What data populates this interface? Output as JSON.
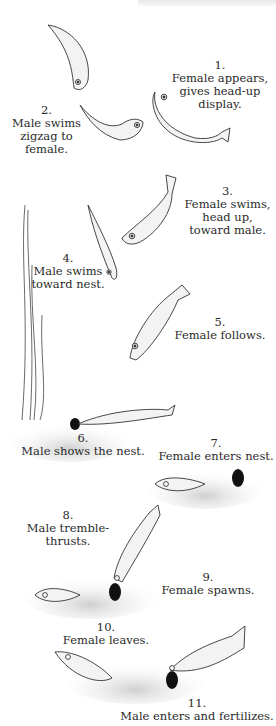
{
  "figure": {
    "steps": [
      {
        "num": "1.",
        "text": [
          "Female appears,",
          "gives head-up",
          "display."
        ]
      },
      {
        "num": "2.",
        "text": [
          "Male swims",
          "zigzag to",
          "female."
        ]
      },
      {
        "num": "3.",
        "text": [
          "Female swims,",
          "head up,",
          "toward male."
        ]
      },
      {
        "num": "4.",
        "text": [
          "Male swims",
          "toward nest."
        ]
      },
      {
        "num": "5.",
        "text": [
          "Female follows."
        ]
      },
      {
        "num": "6.",
        "text": [
          "Male shows the nest."
        ]
      },
      {
        "num": "7.",
        "text": [
          "Female enters nest."
        ]
      },
      {
        "num": "8.",
        "text": [
          "Male tremble-thrusts."
        ]
      },
      {
        "num": "9.",
        "text": [
          "Female spawns."
        ]
      },
      {
        "num": "10.",
        "text": [
          "Female leaves."
        ]
      },
      {
        "num": "11.",
        "text": [
          "Male enters and fertilizes."
        ]
      }
    ]
  }
}
